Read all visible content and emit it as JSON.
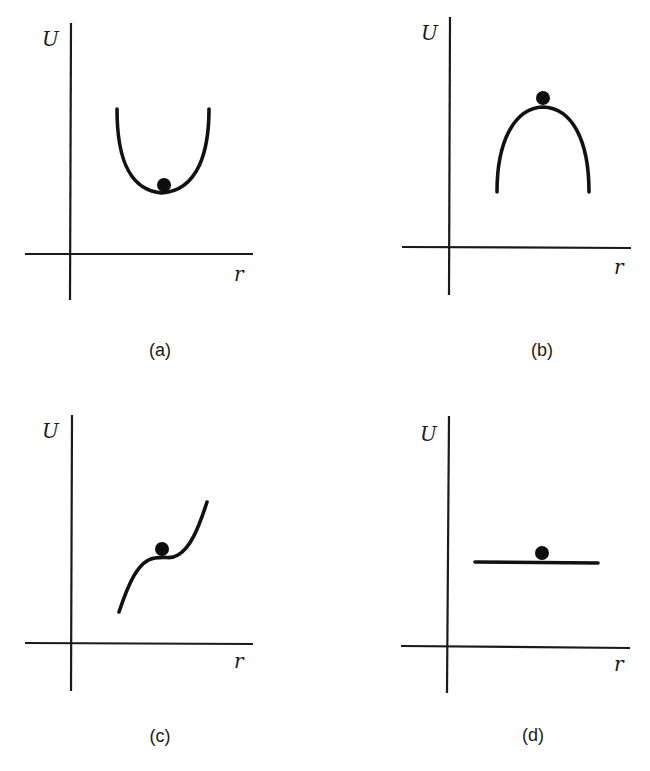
{
  "figure": {
    "panels": [
      {
        "id": "a",
        "label": "(a)",
        "y_axis_label": "U",
        "x_axis_label": "r",
        "curve_shape": "U-shaped well (minimum)",
        "ball_position": "at bottom of well",
        "equilibrium": "stable"
      },
      {
        "id": "b",
        "label": "(b)",
        "y_axis_label": "U",
        "x_axis_label": "r",
        "curve_shape": "inverted U (maximum)",
        "ball_position": "at top of hill",
        "equilibrium": "unstable"
      },
      {
        "id": "c",
        "label": "(c)",
        "y_axis_label": "U",
        "x_axis_label": "r",
        "curve_shape": "rising S-curve with inflection plateau",
        "ball_position": "at inflection point",
        "equilibrium": "unstable (inflection)"
      },
      {
        "id": "d",
        "label": "(d)",
        "y_axis_label": "U",
        "x_axis_label": "r",
        "curve_shape": "horizontal line (constant)",
        "ball_position": "on flat line",
        "equilibrium": "neutral"
      }
    ],
    "colors": {
      "ink": "#111111",
      "background": "#ffffff"
    }
  }
}
